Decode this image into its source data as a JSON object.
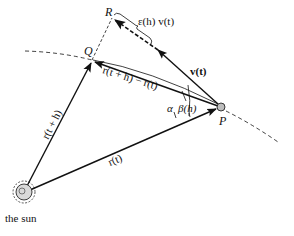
{
  "diagram": {
    "points": {
      "P": {
        "label": "P",
        "x": 221,
        "y": 107
      },
      "Q": {
        "label": "Q",
        "x": 92,
        "y": 60
      },
      "R": {
        "label": "R",
        "x": 112,
        "y": 18
      },
      "sun": {
        "label": "the sun",
        "x": 25,
        "y": 192
      }
    },
    "vectors": {
      "r_t": {
        "label": "r(t)"
      },
      "r_t_plus_h": {
        "label": "r(t + h)"
      },
      "chord": {
        "label": "r(t + h) − r(t)"
      },
      "velocity": {
        "label": "v(t)"
      },
      "error": {
        "label": "ε(h) v(t)"
      }
    },
    "angles": {
      "alpha": "α",
      "beta": "β(h)"
    },
    "labels": {
      "P": "P",
      "Q": "Q",
      "R": "R",
      "sun": "the sun",
      "r_t": "r(t)",
      "r_t_plus_h": "r(t + h)",
      "chord": "r(t + h) − r(t)",
      "velocity": "v(t)",
      "error": "ε(h) v(t)",
      "alpha": "α",
      "beta": "β(h)"
    },
    "colors": {
      "ink": "#111111",
      "background": "#ffffff",
      "planet_fill": "#bdbdbd"
    }
  }
}
